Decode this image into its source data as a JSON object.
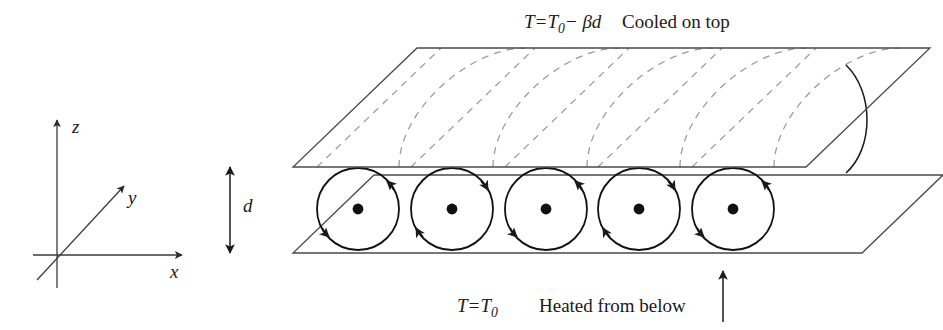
{
  "figure": {
    "labels": {
      "top_temperature": "T=T",
      "top_temperature_sub": "0",
      "top_temperature_rest": "− βd",
      "top_condition": "Cooled on top",
      "bottom_temperature": "T=T",
      "bottom_temperature_sub": "0",
      "bottom_condition": "Heated from below",
      "depth": "d",
      "axis_z": "z",
      "axis_y": "y",
      "axis_x": "x"
    },
    "colors": {
      "stroke": "#1a1a1a",
      "hidden_stroke": "#8c8c8c",
      "plate_stroke": "#4d4d4d",
      "background": "#ffffff",
      "vortex_core": "#111111"
    },
    "geometry": {
      "top_plate": {
        "front_left": [
          293,
          167
        ],
        "front_right": [
          806,
          167
        ],
        "back_right": [
          930,
          48
        ],
        "back_left": [
          417,
          48
        ]
      },
      "bottom_plate": {
        "front_left": [
          293,
          253
        ],
        "front_right": [
          862,
          253
        ],
        "back_right": [
          943,
          175
        ],
        "back_left": [
          374,
          175
        ]
      },
      "rolls": [
        {
          "cx": 358,
          "cy": 209,
          "r": 41,
          "direction": "counterclockwise"
        },
        {
          "cx": 452,
          "cy": 209,
          "r": 41,
          "direction": "clockwise"
        },
        {
          "cx": 546,
          "cy": 209,
          "r": 41,
          "direction": "counterclockwise"
        },
        {
          "cx": 639,
          "cy": 209,
          "r": 41,
          "direction": "clockwise"
        },
        {
          "cx": 733,
          "cy": 209,
          "r": 41,
          "direction": "counterclockwise"
        }
      ],
      "depth_arrow": {
        "x": 230,
        "y_top": 168,
        "y_bottom": 252
      },
      "heat_arrow": {
        "x": 723,
        "y_tail": 322,
        "y_head": 271
      },
      "axes_origin": [
        57,
        255
      ]
    }
  }
}
